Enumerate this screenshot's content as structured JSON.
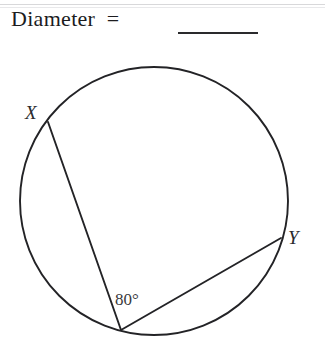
{
  "page": {
    "background_color": "#ffffff",
    "width": 325,
    "height": 345
  },
  "prompt": {
    "text": "Diameter  =",
    "answer_blank": "",
    "blank_present": true
  },
  "figure": {
    "type": "circle-geometry-diagram",
    "stroke_color": "#232326",
    "fill_color": "#ffffff",
    "circle": {
      "center_x": 154,
      "center_y": 201,
      "radius": 134
    },
    "points": [
      {
        "name": "X",
        "label": "X",
        "x": 48,
        "y": 122
      },
      {
        "name": "Y",
        "label": "Y",
        "x": 281,
        "y": 238
      },
      {
        "name": "vertex",
        "label": "",
        "x": 121,
        "y": 330
      }
    ],
    "chords": [
      {
        "name": "chord-vertex-x",
        "from": "vertex",
        "to": "X"
      },
      {
        "name": "chord-vertex-y",
        "from": "vertex",
        "to": "Y"
      }
    ],
    "angle": {
      "label": "80°",
      "value": 80,
      "unit": "degrees",
      "at_point": "vertex"
    }
  }
}
